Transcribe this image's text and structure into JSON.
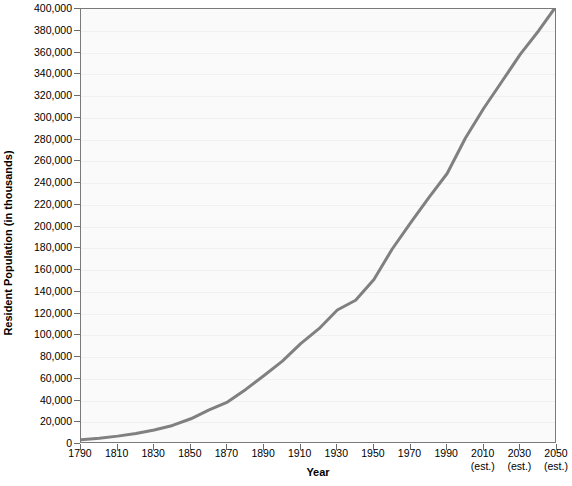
{
  "chart_data": {
    "type": "line",
    "title": "",
    "xlabel": "Year",
    "ylabel": "Resident Population (in thousands)",
    "xlim": [
      1790,
      2050
    ],
    "ylim": [
      0,
      400000
    ],
    "grid": true,
    "legend": "none",
    "line_color": "#808080",
    "plot_background": "#fafafa",
    "x_tick_labels": [
      {
        "value": 1790,
        "label": "1790",
        "note": ""
      },
      {
        "value": 1810,
        "label": "1810",
        "note": ""
      },
      {
        "value": 1830,
        "label": "1830",
        "note": ""
      },
      {
        "value": 1850,
        "label": "1850",
        "note": ""
      },
      {
        "value": 1870,
        "label": "1870",
        "note": ""
      },
      {
        "value": 1890,
        "label": "1890",
        "note": ""
      },
      {
        "value": 1910,
        "label": "1910",
        "note": ""
      },
      {
        "value": 1930,
        "label": "1930",
        "note": ""
      },
      {
        "value": 1950,
        "label": "1950",
        "note": ""
      },
      {
        "value": 1970,
        "label": "1970",
        "note": ""
      },
      {
        "value": 1990,
        "label": "1990",
        "note": ""
      },
      {
        "value": 2010,
        "label": "2010",
        "note": "(est.)"
      },
      {
        "value": 2030,
        "label": "2030",
        "note": "(est.)"
      },
      {
        "value": 2050,
        "label": "2050",
        "note": "(est.)"
      }
    ],
    "y_tick_labels": [
      {
        "value": 0,
        "label": "0"
      },
      {
        "value": 20000,
        "label": "20,000"
      },
      {
        "value": 40000,
        "label": "40,000"
      },
      {
        "value": 60000,
        "label": "60,000"
      },
      {
        "value": 80000,
        "label": "80,000"
      },
      {
        "value": 100000,
        "label": "100,000"
      },
      {
        "value": 120000,
        "label": "120,000"
      },
      {
        "value": 140000,
        "label": "140,000"
      },
      {
        "value": 160000,
        "label": "160,000"
      },
      {
        "value": 180000,
        "label": "180,000"
      },
      {
        "value": 200000,
        "label": "200,000"
      },
      {
        "value": 220000,
        "label": "220,000"
      },
      {
        "value": 240000,
        "label": "240,000"
      },
      {
        "value": 260000,
        "label": "260,000"
      },
      {
        "value": 280000,
        "label": "280,000"
      },
      {
        "value": 300000,
        "label": "300,000"
      },
      {
        "value": 320000,
        "label": "320,000"
      },
      {
        "value": 340000,
        "label": "340,000"
      },
      {
        "value": 360000,
        "label": "360,000"
      },
      {
        "value": 380000,
        "label": "380,000"
      },
      {
        "value": 400000,
        "label": "400,000"
      }
    ],
    "x": [
      1790,
      1800,
      1810,
      1820,
      1830,
      1840,
      1850,
      1860,
      1870,
      1880,
      1890,
      1900,
      1910,
      1920,
      1930,
      1940,
      1950,
      1960,
      1970,
      1980,
      1990,
      2000,
      2010,
      2020,
      2030,
      2040,
      2050
    ],
    "values": [
      3929,
      5308,
      7240,
      9638,
      12866,
      17069,
      23192,
      31443,
      38558,
      50189,
      62980,
      76212,
      92228,
      106021,
      123202,
      132165,
      151326,
      179323,
      203302,
      226542,
      248710,
      281422,
      308746,
      333546,
      358471,
      380016,
      403687
    ],
    "series": [
      {
        "name": "Resident Population",
        "values": [
          3929,
          5308,
          7240,
          9638,
          12866,
          17069,
          23192,
          31443,
          38558,
          50189,
          62980,
          76212,
          92228,
          106021,
          123202,
          132165,
          151326,
          179323,
          203302,
          226542,
          248710,
          281422,
          308746,
          333546,
          358471,
          380016,
          403687
        ]
      }
    ]
  }
}
